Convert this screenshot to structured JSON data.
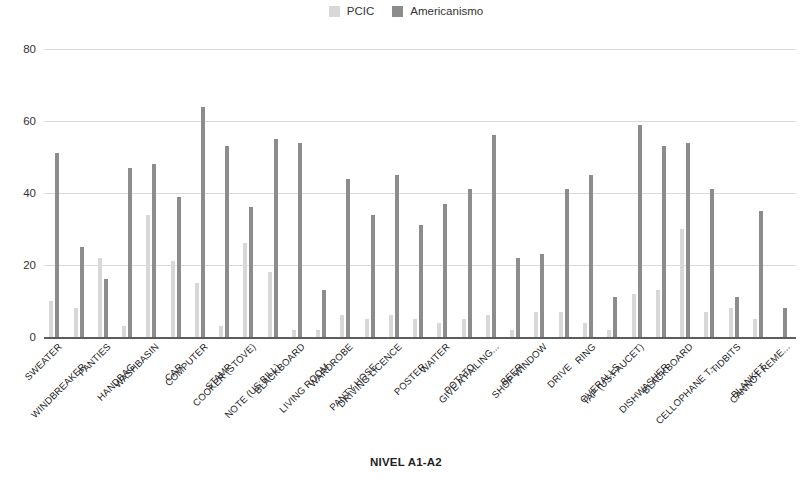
{
  "legend": {
    "position": "top-center",
    "items": [
      {
        "label": "PCIC",
        "color": "#d8d8d8",
        "icon": "legend-swatch-icon"
      },
      {
        "label": "Americanismo",
        "color": "#8c8c8c",
        "icon": "legend-swatch-icon"
      }
    ]
  },
  "axis": {
    "x_title": "NIVEL A1-A2",
    "y_ticks": [
      "0",
      "20",
      "40",
      "60",
      "80"
    ]
  },
  "chart_data": {
    "type": "bar",
    "title": "",
    "subtitle": "",
    "xlabel": "NIVEL A1-A2",
    "ylabel": "",
    "ylim": [
      0,
      80
    ],
    "yticks": [
      0,
      20,
      40,
      60,
      80
    ],
    "grid": true,
    "legend_position": "top-center",
    "categories": [
      "SWEATER",
      "WINDBREAKER",
      "PANTIES",
      "HANDBAG",
      "WASHBASIN",
      "CAR",
      "COMPUTER",
      "STAMP",
      "COOKER (STOVE)",
      "NOTE (US:BILL)",
      "BLACKBOARD",
      "LIVING ROOM",
      "WARDROBE",
      "PANTY HOSE",
      "DRIVING LICENCE",
      "POSTER",
      "WAITER",
      "POTATO",
      "GIVE A FAILING...",
      "BEER",
      "SHOP WINDOW",
      "DRIVE",
      "RING",
      "OVERALLS",
      "TAP (US:FAUCET)",
      "DISHWASHER",
      "BLACKBOARD",
      "CELLOPHANE T...",
      "TIDBITS",
      "BLANKET",
      "CANNOT REME..."
    ],
    "series": [
      {
        "name": "PCIC",
        "color": "#d8d8d8",
        "values": [
          10,
          8,
          22,
          3,
          34,
          21,
          15,
          3,
          26,
          18,
          2,
          2,
          6,
          5,
          6,
          5,
          4,
          5,
          6,
          2,
          7,
          7,
          4,
          2,
          12,
          13,
          30,
          7,
          8,
          5,
          0
        ]
      },
      {
        "name": "Americanismo",
        "color": "#8c8c8c",
        "values": [
          51,
          25,
          16,
          47,
          48,
          39,
          64,
          53,
          36,
          55,
          54,
          13,
          44,
          34,
          45,
          31,
          37,
          41,
          56,
          22,
          23,
          41,
          45,
          11,
          59,
          53,
          54,
          41,
          11,
          35,
          8
        ]
      }
    ]
  }
}
